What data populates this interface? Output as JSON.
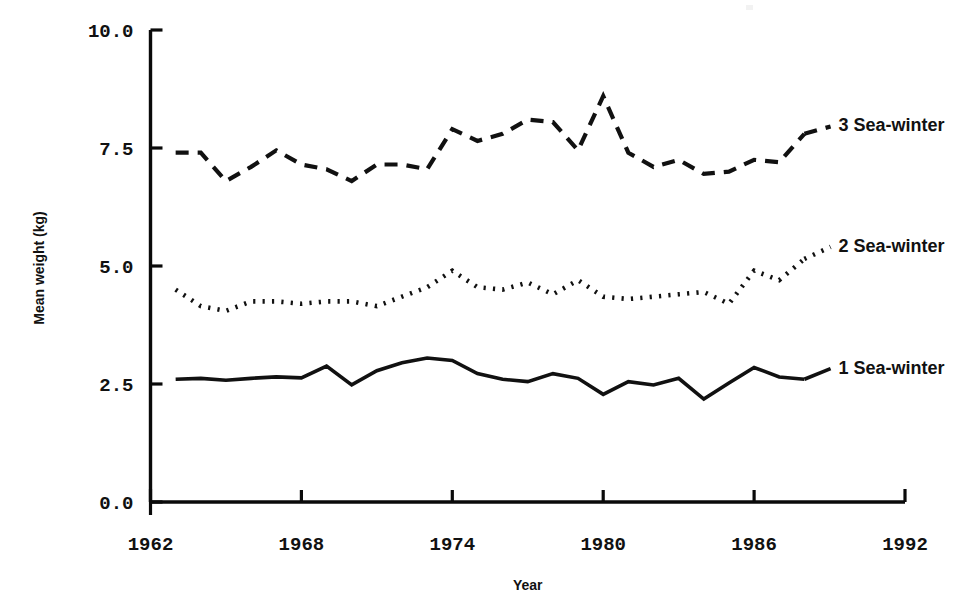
{
  "chart_data": {
    "type": "line",
    "title": "",
    "xlabel": "Year",
    "ylabel": "Mean weight (kg)",
    "xlim": [
      1962,
      1992
    ],
    "ylim": [
      0.0,
      10.0
    ],
    "grid": false,
    "legend_position": "right-inline",
    "x_ticks": [
      "1962",
      "1968",
      "1974",
      "1980",
      "1986",
      "1992"
    ],
    "x_tick_values": [
      1962,
      1968,
      1974,
      1980,
      1986,
      1992
    ],
    "y_ticks": [
      "0.0",
      "2.5",
      "5.0",
      "7.5",
      "10.0"
    ],
    "y_tick_values": [
      0.0,
      2.5,
      5.0,
      7.5,
      10.0
    ],
    "x": [
      1963,
      1964,
      1965,
      1966,
      1967,
      1968,
      1969,
      1970,
      1971,
      1972,
      1973,
      1974,
      1975,
      1976,
      1977,
      1978,
      1979,
      1980,
      1981,
      1982,
      1983,
      1984,
      1985,
      1986,
      1987,
      1988
    ],
    "series": [
      {
        "name": "3 Sea-winter",
        "label": "3 Sea-winter",
        "style": "dashed",
        "dash": "13 9",
        "width": 4.2,
        "color": "#111111",
        "label_x": 1989.2,
        "label_y": 7.85,
        "values": [
          7.4,
          7.4,
          6.8,
          7.1,
          7.45,
          7.15,
          7.05,
          6.8,
          7.15,
          7.15,
          7.05,
          7.9,
          7.65,
          7.8,
          8.1,
          8.05,
          7.45,
          8.6,
          7.4,
          7.1,
          7.25,
          6.95,
          7.0,
          7.25,
          7.2,
          7.8
        ]
      },
      {
        "name": "2 Sea-winter",
        "label": "2 Sea-winter",
        "style": "dotted",
        "dash": "2.2 7.2",
        "width": 4.6,
        "color": "#111111",
        "label_x": 1989.2,
        "label_y": 5.3,
        "values": [
          4.5,
          4.15,
          4.05,
          4.25,
          4.25,
          4.2,
          4.25,
          4.25,
          4.15,
          4.35,
          4.55,
          4.9,
          4.55,
          4.5,
          4.65,
          4.4,
          4.7,
          4.35,
          4.3,
          4.35,
          4.4,
          4.45,
          4.2,
          4.9,
          4.7,
          5.15
        ]
      },
      {
        "name": "1 Sea-winter",
        "label": "1 Sea-winter",
        "style": "solid",
        "dash": "",
        "width": 3.6,
        "color": "#111111",
        "label_x": 1989.2,
        "label_y": 2.72,
        "values": [
          2.6,
          2.62,
          2.58,
          2.62,
          2.65,
          2.63,
          2.88,
          2.48,
          2.78,
          2.95,
          3.05,
          3.0,
          2.72,
          2.6,
          2.55,
          2.72,
          2.62,
          2.28,
          2.55,
          2.48,
          2.62,
          2.18,
          2.52,
          2.85,
          2.65,
          2.6
        ]
      }
    ]
  },
  "axes": {
    "y_axis_name": "value-axis",
    "x_axis_name": "year-axis"
  }
}
